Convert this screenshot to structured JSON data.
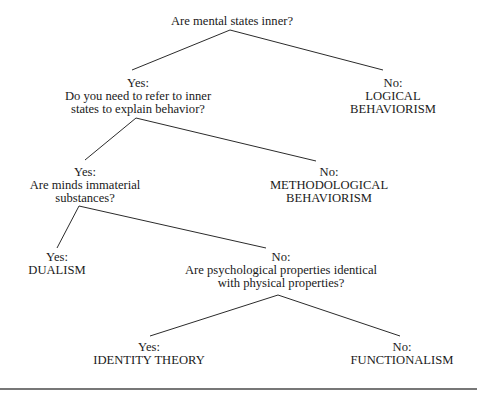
{
  "diagram": {
    "type": "decision-tree",
    "root": {
      "id": "q1",
      "question": "Are mental states inner?"
    },
    "nodes": [
      {
        "id": "q1-yes",
        "answer": "Yes:",
        "lines": [
          "Do you need to refer to inner",
          "states to explain behavior?"
        ]
      },
      {
        "id": "q1-no",
        "answer": "No:",
        "lines": [
          "LOGICAL",
          "BEHAVIORISM"
        ]
      },
      {
        "id": "q2-yes",
        "answer": "Yes:",
        "lines": [
          "Are minds immaterial",
          "substances?"
        ]
      },
      {
        "id": "q2-no",
        "answer": "No:",
        "lines": [
          "METHODOLOGICAL",
          "BEHAVIORISM"
        ]
      },
      {
        "id": "q3-yes",
        "answer": "Yes:",
        "lines": [
          "DUALISM"
        ]
      },
      {
        "id": "q3-no",
        "answer": "No:",
        "lines": [
          "Are psychological properties identical",
          "with physical properties?"
        ]
      },
      {
        "id": "q4-yes",
        "answer": "Yes:",
        "lines": [
          "IDENTITY THEORY"
        ]
      },
      {
        "id": "q4-no",
        "answer": "No:",
        "lines": [
          "FUNCTIONALISM"
        ]
      }
    ],
    "edges": [
      {
        "from": "q1",
        "to": "q1-yes"
      },
      {
        "from": "q1",
        "to": "q1-no"
      },
      {
        "from": "q1-yes",
        "to": "q2-yes"
      },
      {
        "from": "q1-yes",
        "to": "q2-no"
      },
      {
        "from": "q2-yes",
        "to": "q3-yes"
      },
      {
        "from": "q2-yes",
        "to": "q3-no"
      },
      {
        "from": "q3-no",
        "to": "q4-yes"
      },
      {
        "from": "q3-no",
        "to": "q4-no"
      }
    ],
    "colors": {
      "text": "#1a1a1a",
      "lines": "#2b2b2b",
      "rule": "#777777",
      "background": "#ffffff"
    }
  }
}
